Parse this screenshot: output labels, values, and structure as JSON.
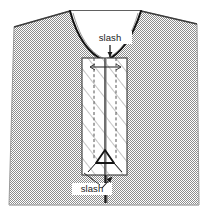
{
  "figure": {
    "kind": "garment-construction-diagram",
    "background_color": "#ffffff",
    "body_fill_color": "#bfbfbf",
    "body_stroke_color": "#7a7a7a",
    "neckline_stroke_color": "#1a1a1a",
    "panel_fill_color": "#ffffff",
    "panel_stroke_color": "#3a3a3a",
    "hatch_color": "#8a8a8a",
    "dashed_line_color": "#444444",
    "center_line_color": "#555555",
    "arrow_color": "#1a1a1a",
    "label_color": "#1a1a1a"
  },
  "labels": {
    "top_slash": "slash",
    "bottom_slash": "slash"
  },
  "annotations": [
    {
      "name": "top-slash-callout",
      "text": "slash",
      "text_x": 110,
      "text_y": 41,
      "arrow_from_x": 110,
      "arrow_from_y": 45,
      "arrow_to_x": 110,
      "arrow_to_y": 62
    },
    {
      "name": "bottom-slash-callout",
      "text": "slash",
      "text_x": 92,
      "text_y": 192,
      "arrow_from_x": 101,
      "arrow_from_y": 188,
      "arrow_to_x": 112,
      "arrow_to_y": 176
    }
  ],
  "geometry": {
    "body_outline": "M 70 11 L 141 11 L 197 24 L 199 205 L 9 205 L 14 27 Z",
    "neckline_curve": "M 70 11 C 76 32 85 52 105 61 C 125 52 134 32 141 11",
    "panel": {
      "x": 82,
      "y": 58,
      "width": 45,
      "height": 117
    },
    "center_slash_line_x": 105,
    "dashed_line_left_x": 94,
    "dashed_line_right_x": 116,
    "point_marker_y": 158,
    "hatch_angle_degrees": -38,
    "hatch_spacing": 11
  }
}
